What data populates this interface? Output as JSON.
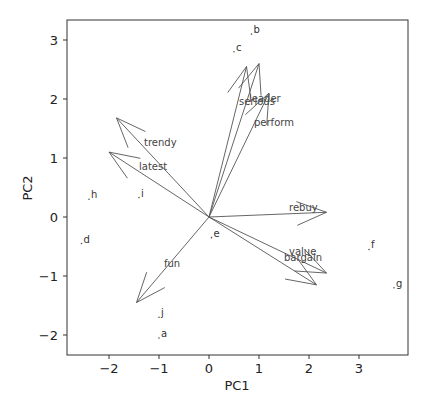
{
  "chart_data": {
    "type": "scatter",
    "subtype": "pca-biplot",
    "title": "",
    "xlabel": "PC1",
    "ylabel": "PC2",
    "xlim": [
      -2.8,
      3.9
    ],
    "ylim": [
      -2.35,
      3.3
    ],
    "xticks": [
      -2,
      -1,
      0,
      1,
      2,
      3
    ],
    "yticks": [
      -2,
      -1,
      0,
      1,
      2,
      3
    ],
    "grid": false,
    "points": [
      {
        "label": "a",
        "x": -1.0,
        "y": -2.05
      },
      {
        "label": "b",
        "x": 0.85,
        "y": 3.1
      },
      {
        "label": "c",
        "x": 0.5,
        "y": 2.8
      },
      {
        "label": "d",
        "x": -2.55,
        "y": -0.45
      },
      {
        "label": "e",
        "x": 0.05,
        "y": -0.35
      },
      {
        "label": "f",
        "x": 3.2,
        "y": -0.55
      },
      {
        "label": "g",
        "x": 3.7,
        "y": -1.2
      },
      {
        "label": "h",
        "x": -2.4,
        "y": 0.3
      },
      {
        "label": "i",
        "x": -1.4,
        "y": 0.33
      },
      {
        "label": "j",
        "x": -1.0,
        "y": -1.7
      }
    ],
    "loadings": [
      {
        "label": "trendy",
        "x": -1.85,
        "y": 1.68,
        "label_x": -1.3,
        "label_y": 1.2
      },
      {
        "label": "latest",
        "x": -2.0,
        "y": 1.1,
        "label_x": -1.4,
        "label_y": 0.8
      },
      {
        "label": "leader",
        "x": 1.0,
        "y": 2.6,
        "label_x": 0.8,
        "label_y": 1.95
      },
      {
        "label": "serious",
        "x": 0.75,
        "y": 2.55,
        "label_x": 0.6,
        "label_y": 1.9
      },
      {
        "label": "perform",
        "x": 1.2,
        "y": 2.1,
        "label_x": 0.9,
        "label_y": 1.55
      },
      {
        "label": "rebuy",
        "x": 2.35,
        "y": 0.08,
        "label_x": 1.6,
        "label_y": 0.1
      },
      {
        "label": "value",
        "x": 2.35,
        "y": -0.95,
        "label_x": 1.6,
        "label_y": -0.65
      },
      {
        "label": "bargain",
        "x": 2.15,
        "y": -1.15,
        "label_x": 1.5,
        "label_y": -0.75
      },
      {
        "label": "fun",
        "x": -1.45,
        "y": -1.45,
        "label_x": -0.9,
        "label_y": -0.85
      }
    ]
  }
}
